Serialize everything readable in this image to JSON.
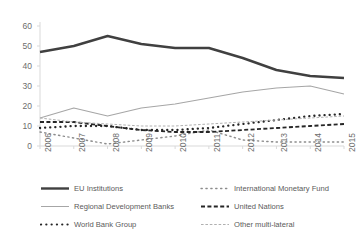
{
  "chart_data": {
    "type": "line",
    "title": "",
    "xlabel": "",
    "ylabel": "",
    "categories": [
      "2006",
      "2007",
      "2008",
      "2009",
      "2010",
      "2011",
      "2012",
      "2013",
      "2014",
      "2015"
    ],
    "ylim": [
      0,
      60
    ],
    "yticks": [
      0,
      10,
      20,
      30,
      40,
      50,
      60
    ],
    "grid": false,
    "legend_position": "bottom",
    "series": [
      {
        "name": "EU Institutions",
        "style": "solid-thick-black",
        "color": "#404040",
        "values": [
          47,
          50,
          55,
          51,
          49,
          49,
          44,
          38,
          35,
          34
        ]
      },
      {
        "name": "International Monetary Fund",
        "style": "dotted-fine-gray",
        "color": "#8c8c8c",
        "values": [
          7,
          4,
          1,
          3,
          5,
          8,
          3,
          2,
          2,
          2
        ]
      },
      {
        "name": "Regional Development Banks",
        "style": "solid-thin-gray",
        "color": "#a6a6a6",
        "values": [
          14,
          19,
          15,
          19,
          21,
          24,
          27,
          29,
          30,
          26
        ]
      },
      {
        "name": "United Nations",
        "style": "dashed-black",
        "color": "#262626",
        "values": [
          12,
          12,
          10,
          8,
          7,
          7,
          8,
          9,
          10,
          11
        ]
      },
      {
        "name": "World Bank Group",
        "style": "dotted-thick-black",
        "color": "#262626",
        "values": [
          9,
          10,
          10,
          8,
          8,
          9,
          11,
          13,
          15,
          16
        ]
      },
      {
        "name": "Other multi-lateral",
        "style": "dashed-fine-gray",
        "color": "#b0b0b0",
        "values": [
          14,
          12,
          11,
          10,
          10,
          11,
          12,
          13,
          14,
          15
        ]
      }
    ]
  },
  "axis": {
    "y_ticks": [
      "0",
      "10",
      "20",
      "30",
      "40",
      "50",
      "60"
    ],
    "x_ticks": [
      "2006",
      "2007",
      "2008",
      "2009",
      "2010",
      "2011",
      "2012",
      "2013",
      "2014",
      "2015"
    ]
  },
  "legend": {
    "items": [
      {
        "label": "EU Institutions",
        "key": "line-key-solid-thick-black"
      },
      {
        "label": "International Monetary Fund",
        "key": "line-key-dotted-fine-gray"
      },
      {
        "label": "Regional Development Banks",
        "key": "line-key-solid-thin-gray"
      },
      {
        "label": "United Nations",
        "key": "line-key-dashed-black"
      },
      {
        "label": "World Bank Group",
        "key": "line-key-dotted-thick-black"
      },
      {
        "label": "Other multi-lateral",
        "key": "line-key-dashed-fine-gray"
      }
    ]
  },
  "colors": {
    "eu": "#404040",
    "imf": "#8c8c8c",
    "rdb": "#a6a6a6",
    "un": "#262626",
    "wbg": "#262626",
    "other": "#b0b0b0",
    "axis": "#d9d9d9",
    "text": "#6d6d6d"
  }
}
